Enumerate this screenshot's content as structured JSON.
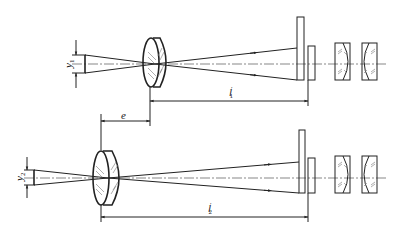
{
  "diagram": {
    "type": "optical-schematic",
    "top": {
      "object_label": "y",
      "object_subscript": "1",
      "image_distance_label": "l",
      "image_distance_subscript": "1",
      "image_distance_prime": "′"
    },
    "shift": {
      "label": "e"
    },
    "bottom": {
      "object_label": "y",
      "object_subscript": "2",
      "image_distance_label": "l",
      "image_distance_subscript": "2",
      "image_distance_prime": "′"
    },
    "components": [
      "object",
      "objective-lens",
      "reticle-plate",
      "field-plate",
      "eyepiece-lens-1",
      "eyepiece-lens-2"
    ],
    "colors": {
      "line": "#222222",
      "axis": "#555555",
      "background": "#ffffff"
    }
  }
}
